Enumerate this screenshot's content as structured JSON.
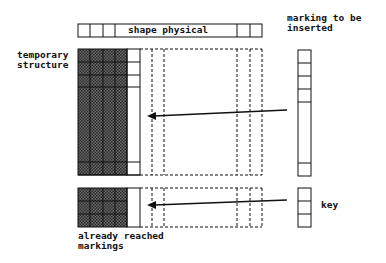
{
  "diagram": {
    "top_bar_label": "shape physical",
    "labels": {
      "temporary_line1": "temporary",
      "temporary_line2": "structure",
      "marking_line1": "marking to be",
      "marking_line2": "inserted",
      "already_line1": "already reached",
      "already_line2": "markings",
      "key": "key"
    },
    "colors": {
      "line": "#111111",
      "shaded": "#555555",
      "background": "#ffffff"
    }
  }
}
